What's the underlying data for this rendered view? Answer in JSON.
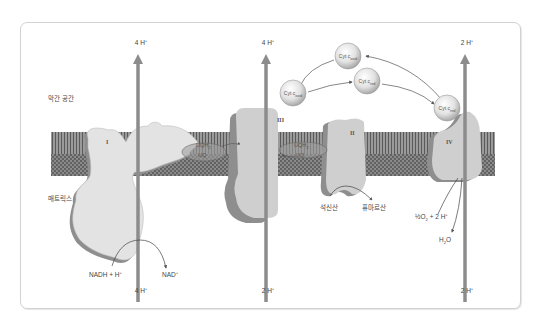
{
  "figure": {
    "regions": {
      "intermembrane_space": "막간 공간",
      "matrix": "매트릭스"
    },
    "complexes": {
      "I": "I",
      "II": "II",
      "III": "III",
      "IV": "IV"
    },
    "proton_pumps": {
      "complex_I_top": "4 H",
      "complex_I_bottom": "4 H",
      "complex_III_top": "4 H",
      "complex_III_bottom": "2 H",
      "complex_IV_top": "2 H",
      "complex_IV_bottom": "2 H",
      "superscript": "+"
    },
    "ubiquinone": {
      "left_reduced": "UQH",
      "left_reduced_sub": "2",
      "left_oxidized": "UQ",
      "right_reduced": "UQH",
      "right_reduced_sub": "2",
      "right_oxidized": "UQ"
    },
    "cytochrome_c": {
      "prefix": "Cyt c",
      "top_left": "oxid",
      "left": "oxid",
      "middle": "red",
      "right": "red"
    },
    "reactions": {
      "nadh": "NADH  +  H",
      "nad": "NAD",
      "succinate": "석신산",
      "fumarate": "퓨마르산",
      "oxygen_prefix": "½O",
      "oxygen_sub": "2",
      "oxygen_suffix": " + 2 H",
      "water_h": "H",
      "water_sub": "2",
      "water_o": "O"
    },
    "colors": {
      "membrane": "#7a7a7a",
      "protein_fill": "#cfcfcf",
      "protein_shadow": "#8e8e8e",
      "arrow": "#8c8c8c",
      "complex_I_fill": "#e3e3e3"
    }
  }
}
